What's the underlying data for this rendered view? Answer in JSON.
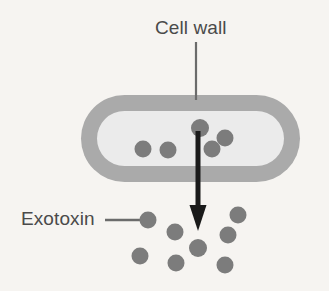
{
  "diagram": {
    "title_visible": false,
    "background_color": "#f6f4f1",
    "labels": {
      "cell_wall": "Cell wall",
      "exotoxin": "Exotoxin"
    },
    "colors": {
      "cell_wall": "#aaaaaa",
      "cell_interior": "#ebebeb",
      "toxin_dot": "#7c7c7c",
      "arrow": "#1a1a1a",
      "leader_line": "#6b6b6b",
      "text": "#4a4a4a",
      "background": "#f6f4f1"
    },
    "cell": {
      "shape": "rounded-capsule",
      "x": 81,
      "y": 95,
      "width": 219,
      "height": 87,
      "wall_thickness": 16
    },
    "arrow": {
      "label": "toxin-secretion-arrow",
      "x": 198,
      "y_start": 131,
      "y_end": 231,
      "shaft_width": 5,
      "head_width": 17,
      "head_length": 26,
      "direction": "down"
    },
    "cell_wall_leader": {
      "x": 196,
      "y_start": 42,
      "y_end": 100
    },
    "exotoxin_leader": {
      "x_start": 105,
      "x_end": 145,
      "y": 220
    },
    "dot_radius": 8.5,
    "dots_inside_cell": [
      {
        "cx": 143,
        "cy": 149
      },
      {
        "cx": 168,
        "cy": 150
      },
      {
        "cx": 200,
        "cy": 128
      },
      {
        "cx": 225,
        "cy": 138
      },
      {
        "cx": 212,
        "cy": 149
      }
    ],
    "dots_outside_cell": [
      {
        "cx": 148,
        "cy": 220
      },
      {
        "cx": 175,
        "cy": 232
      },
      {
        "cx": 238,
        "cy": 215
      },
      {
        "cx": 228,
        "cy": 235
      },
      {
        "cx": 198,
        "cy": 248
      },
      {
        "cx": 140,
        "cy": 256
      },
      {
        "cx": 176,
        "cy": 263
      },
      {
        "cx": 225,
        "cy": 265
      }
    ]
  }
}
